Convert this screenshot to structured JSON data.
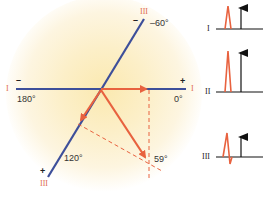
{
  "figure": {
    "type": "hexaxial-lead-projection",
    "colors": {
      "lead_axis": "#3d4f9a",
      "vector": "#e8623f",
      "lead_label": "#e06a4e",
      "text": "#333333",
      "glow": "#fbe9b0",
      "ecg_wave": "#e8623f",
      "ecg_arrow": "#111111"
    }
  },
  "axes": {
    "lead_I": {
      "name": "I",
      "left_label": "I",
      "right_label": "I",
      "negative_sign": "–",
      "positive_sign": "+",
      "left_angle": "180°",
      "right_angle": "0°"
    },
    "lead_III": {
      "name": "III",
      "top_label": "III",
      "bottom_label": "III",
      "negative_sign": "–",
      "positive_sign": "+",
      "top_angle": "–60°",
      "bottom_angle": "120°"
    }
  },
  "vectors": {
    "mean_axis_angle": "59°",
    "projections": [
      {
        "name": "projection-on-lead-I",
        "direction": "0°"
      },
      {
        "name": "projection-on-lead-III",
        "direction": "120°"
      },
      {
        "name": "mean-qrs-vector",
        "direction": "59°"
      }
    ]
  },
  "ecg_panels": [
    {
      "lead": "I",
      "arrow": "up",
      "wave": "positive"
    },
    {
      "lead": "II",
      "arrow": "up",
      "wave": "positive"
    },
    {
      "lead": "III",
      "arrow": "up",
      "wave": "biphasic"
    }
  ]
}
